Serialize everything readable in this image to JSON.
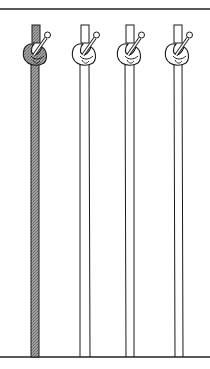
{
  "figure": {
    "caption": "",
    "colors": {
      "line": "#1a1a1a",
      "shaded_rope": "#8c8c8c",
      "shaded_dark": "#6e6e6e",
      "background": "#ffffff"
    },
    "ropes": [
      {
        "id": 1,
        "shaded": true,
        "x": 36
      },
      {
        "id": 2,
        "shaded": false,
        "x": 85
      },
      {
        "id": 3,
        "shaded": false,
        "x": 130
      },
      {
        "id": 4,
        "shaded": false,
        "x": 178
      }
    ],
    "top_rule_y": 9,
    "bottom_rule_y": 357
  }
}
